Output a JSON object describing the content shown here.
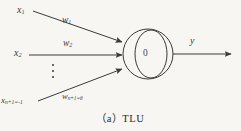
{
  "figure": {
    "caption_marker": "（a）",
    "caption_text": "TLU",
    "caption_full": "（a）TLU",
    "background_color": "#f7f6f3",
    "ink_color": "#3a3a3a"
  },
  "inputs": [
    {
      "name": "input-1",
      "variable": "x",
      "subscript": "1",
      "weight_variable": "w",
      "weight_subscript": "1"
    },
    {
      "name": "input-2",
      "variable": "x",
      "subscript": "2",
      "weight_variable": "w",
      "weight_subscript": "2"
    },
    {
      "name": "input-bias",
      "variable": "x",
      "subscript": "n+1",
      "value": "=-1",
      "weight_variable": "w",
      "weight_subscript": "n+1",
      "weight_value": "=θ"
    }
  ],
  "labels": {
    "x1": "x",
    "x1_sub": "1",
    "w1": "w",
    "w1_sub": "1",
    "x2": "x",
    "x2_sub": "2",
    "w2": "w",
    "w2_sub": "2",
    "xn": "x",
    "xn_sub": "n+1=-1",
    "wn": "w",
    "wn_sub": "n+1=θ",
    "output": "y",
    "threshold": "0",
    "ellipsis": "⋮"
  },
  "node": {
    "name": "tlu-node",
    "threshold_value": "0",
    "shape": "circle-with-inner-arc"
  }
}
